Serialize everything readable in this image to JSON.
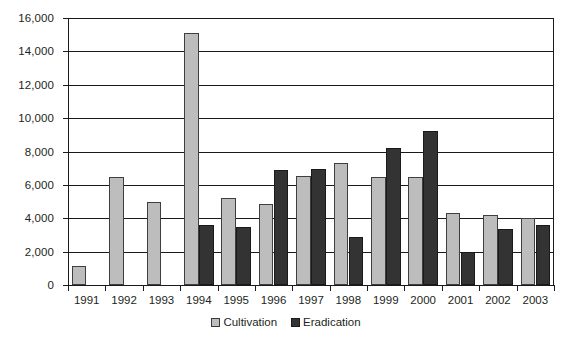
{
  "chart_data": {
    "type": "bar",
    "title": "",
    "subtitle": "",
    "xlabel": "",
    "ylabel": "",
    "categories": [
      "1991",
      "1992",
      "1993",
      "1994",
      "1995",
      "1996",
      "1997",
      "1998",
      "1999",
      "2000",
      "2001",
      "2002",
      "2003"
    ],
    "series": [
      {
        "name": "Cultivation",
        "color": "#bdbdbd",
        "values": [
          1150,
          6500,
          5000,
          15100,
          5200,
          4850,
          6550,
          7300,
          6450,
          6500,
          4300,
          4200,
          4000
        ]
      },
      {
        "name": "Eradication",
        "color": "#333333",
        "values": [
          null,
          null,
          null,
          3600,
          3450,
          6900,
          6950,
          2850,
          8200,
          9200,
          2000,
          3350,
          3600
        ]
      }
    ],
    "ylim": [
      0,
      16000
    ],
    "yticks": [
      0,
      2000,
      4000,
      6000,
      8000,
      10000,
      12000,
      14000,
      16000
    ],
    "ytick_labels": [
      "0",
      "2,000",
      "4,000",
      "6,000",
      "8,000",
      "10,000",
      "12,000",
      "14,000",
      "16,000"
    ],
    "grid": true,
    "grid_axis": "y",
    "legend_position": "bottom",
    "legend": [
      "Cultivation",
      "Eradication"
    ]
  }
}
